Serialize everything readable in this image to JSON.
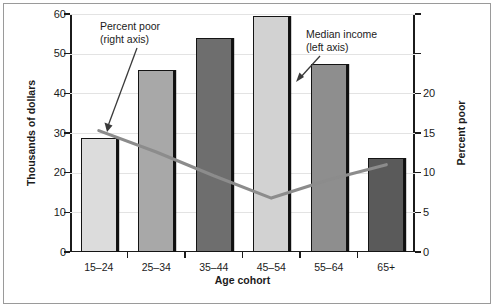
{
  "chart_data": {
    "type": "bar",
    "title": "",
    "subtitle": "",
    "xlabel": "Age cohort",
    "ylabel": "Thousands of dollars",
    "y2label": "Percent poor",
    "categories": [
      "15–24",
      "25–34",
      "35–44",
      "45–54",
      "55–64",
      "65+"
    ],
    "ylim": [
      0,
      60
    ],
    "yticks": [
      0,
      10,
      20,
      30,
      40,
      50,
      60
    ],
    "ytick_labels": [
      "0",
      "10",
      "20",
      "30",
      "40",
      "50",
      "60"
    ],
    "y2lim": [
      0,
      30
    ],
    "y2ticks": [
      0,
      5,
      10,
      15,
      20,
      25,
      30
    ],
    "y2tick_labels": [
      "0",
      "5",
      "10",
      "15",
      "20",
      "",
      ""
    ],
    "grid": true,
    "legend_position": "none",
    "series": [
      {
        "name": "Median income",
        "type": "bar",
        "axis": "left",
        "unit": "Thousands of dollars",
        "values": [
          28.8,
          45.8,
          54.0,
          59.4,
          47.5,
          23.7
        ],
        "colors": [
          "#dcdcdc",
          "#a8a8a8",
          "#6e6e6e",
          "#d2d2d2",
          "#8e8e8e",
          "#5a5a5a"
        ]
      },
      {
        "name": "Percent poor",
        "type": "line",
        "axis": "right",
        "unit": "Percent poor",
        "values": [
          15.3,
          12.6,
          9.6,
          6.8,
          9.1,
          11.0
        ],
        "color": "#8c8c8c"
      }
    ],
    "annotations": [
      {
        "id": "percent-poor",
        "text": "Percent poor\n(right axis)",
        "points_to": "percent-poor-line"
      },
      {
        "id": "median-income",
        "text": "Median income\n(left axis)",
        "points_to": "median-income-bars"
      }
    ]
  },
  "axes": {
    "left_title": "Thousands of dollars",
    "right_title": "Percent poor",
    "x_title": "Age cohort"
  },
  "ticks": {
    "left": [
      "60",
      "50",
      "40",
      "30",
      "20",
      "10",
      "0"
    ],
    "right": [
      "",
      "",
      "20",
      "15",
      "10",
      "5",
      "0"
    ],
    "x": [
      "15–24",
      "25–34",
      "35–44",
      "45–54",
      "55–64",
      "65+"
    ]
  },
  "annotations": {
    "percent_poor": "Percent poor\n(right axis)",
    "median_income": "Median income\n(left axis)"
  }
}
